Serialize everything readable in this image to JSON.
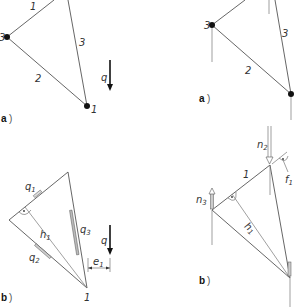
{
  "figure": {
    "top_left": {
      "panel_label": "a",
      "nodes": [
        "3",
        "1"
      ],
      "members": [
        "1",
        "2",
        "3"
      ],
      "load_label": "q"
    },
    "top_right": {
      "panel_label": "a",
      "nodes": [
        "3"
      ],
      "members": [
        "2",
        "3"
      ]
    },
    "bottom_left": {
      "panel_label": "b",
      "node_label": "1",
      "forces": [
        "q",
        "1",
        "q",
        "2",
        "q",
        "3"
      ],
      "height_label": "h",
      "height_sub": "1",
      "eccentricity_label": "e",
      "eccentricity_sub": "1",
      "load_label": "q",
      "q1": "q",
      "q1_sub": "1",
      "q2": "q",
      "q2_sub": "2",
      "q3": "q",
      "q3_sub": "3"
    },
    "bottom_right": {
      "panel_label": "b",
      "member_label": "1",
      "n2": "n",
      "n2_sub": "2",
      "n3": "n",
      "n3_sub": "3",
      "h1": "h",
      "h1_sub": "1",
      "f1": "f",
      "f1_sub": "1"
    }
  }
}
